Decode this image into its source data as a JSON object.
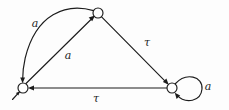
{
  "diagram": {
    "type": "labelled-transition-system",
    "title": "",
    "background_color": "#fdfdfd",
    "stroke_color": "#1c1c1c",
    "node_fill_color": "#ffffff",
    "nodes": [
      {
        "id": "s0",
        "label": "",
        "cx": 23,
        "cy": 88,
        "r": 5,
        "initial": true
      },
      {
        "id": "s1",
        "label": "",
        "cx": 98,
        "cy": 13,
        "r": 5,
        "initial": false
      },
      {
        "id": "s2",
        "label": "",
        "cx": 172,
        "cy": 88,
        "r": 5,
        "initial": false
      }
    ],
    "edges": [
      {
        "id": "e1",
        "from": "s1",
        "to": "s0",
        "label": "a",
        "shape": "curve",
        "label_x": 35,
        "label_y": 23
      },
      {
        "id": "e2",
        "from": "s0",
        "to": "s1",
        "label": "a",
        "shape": "straight",
        "label_x": 68,
        "label_y": 55
      },
      {
        "id": "e3",
        "from": "s1",
        "to": "s2",
        "label": "τ",
        "shape": "straight",
        "label_x": 147,
        "label_y": 42
      },
      {
        "id": "e4",
        "from": "s2",
        "to": "s0",
        "label": "τ",
        "shape": "straight",
        "label_x": 96,
        "label_y": 98
      },
      {
        "id": "e5",
        "from": "s2",
        "to": "s2",
        "label": "a",
        "shape": "self-loop",
        "label_x": 208,
        "label_y": 86
      }
    ],
    "labels": {
      "a_curve": "a",
      "a_diagonal": "a",
      "tau_right": "τ",
      "tau_bottom": "τ",
      "a_loop": "a"
    }
  }
}
